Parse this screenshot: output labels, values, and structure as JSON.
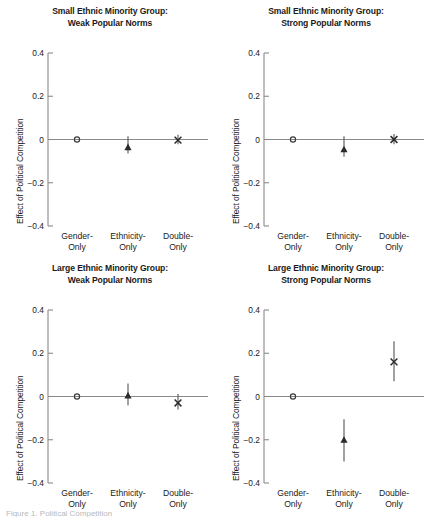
{
  "figure": {
    "ylabel": "Effect of Political Competition",
    "yticks": [
      "0.4",
      "0.2",
      "0",
      "−0.2",
      "−0.4"
    ],
    "categories": [
      {
        "line1": "Gender-",
        "line2": "Only"
      },
      {
        "line1": "Ethnicity-",
        "line2": "Only"
      },
      {
        "line1": "Double-",
        "line2": "Only"
      }
    ],
    "caption": "Figure 1. Political Competition"
  },
  "chart_data": {
    "type": "scatter",
    "xlabel": "",
    "ylabel": "Effect of Political Competition",
    "ylim": [
      -0.4,
      0.4
    ],
    "yticks": [
      0.4,
      0.2,
      0,
      -0.2,
      -0.4
    ],
    "grid": false,
    "legend": "none",
    "categories": [
      "Gender-Only",
      "Ethnicity-Only",
      "Double-Only"
    ],
    "markers": [
      "circle",
      "triangle",
      "cross"
    ],
    "panels": [
      {
        "id": "small-weak",
        "position": "top-left",
        "title_line1": "Small Ethnic Minority Group:",
        "title_line2": "Weak Popular Norms",
        "points": [
          {
            "category": "Gender-Only",
            "marker": "circle",
            "value": 0.0,
            "ci_low": 0.0,
            "ci_high": 0.0
          },
          {
            "category": "Ethnicity-Only",
            "marker": "triangle",
            "value": -0.035,
            "ci_low": -0.065,
            "ci_high": 0.015
          },
          {
            "category": "Double-Only",
            "marker": "cross",
            "value": -0.003,
            "ci_low": -0.022,
            "ci_high": 0.022
          }
        ]
      },
      {
        "id": "small-strong",
        "position": "top-right",
        "title_line1": "Small Ethnic Minority Group:",
        "title_line2": "Strong Popular Norms",
        "points": [
          {
            "category": "Gender-Only",
            "marker": "circle",
            "value": 0.0,
            "ci_low": 0.0,
            "ci_high": 0.0
          },
          {
            "category": "Ethnicity-Only",
            "marker": "triangle",
            "value": -0.045,
            "ci_low": -0.08,
            "ci_high": 0.015
          },
          {
            "category": "Double-Only",
            "marker": "cross",
            "value": 0.0,
            "ci_low": -0.022,
            "ci_high": 0.025
          }
        ]
      },
      {
        "id": "large-weak",
        "position": "bottom-left",
        "title_line1": "Large Ethnic Minority Group:",
        "title_line2": "Weak Popular Norms",
        "points": [
          {
            "category": "Gender-Only",
            "marker": "circle",
            "value": 0.0,
            "ci_low": 0.0,
            "ci_high": 0.0
          },
          {
            "category": "Ethnicity-Only",
            "marker": "triangle",
            "value": 0.005,
            "ci_low": -0.04,
            "ci_high": 0.06
          },
          {
            "category": "Double-Only",
            "marker": "cross",
            "value": -0.03,
            "ci_low": -0.06,
            "ci_high": 0.012
          }
        ]
      },
      {
        "id": "large-strong",
        "position": "bottom-right",
        "title_line1": "Large Ethnic Minority Group:",
        "title_line2": "Strong Popular Norms",
        "points": [
          {
            "category": "Gender-Only",
            "marker": "circle",
            "value": 0.0,
            "ci_low": 0.0,
            "ci_high": 0.0
          },
          {
            "category": "Ethnicity-Only",
            "marker": "triangle",
            "value": -0.2,
            "ci_low": -0.3,
            "ci_high": -0.105
          },
          {
            "category": "Double-Only",
            "marker": "cross",
            "value": 0.16,
            "ci_low": 0.07,
            "ci_high": 0.255
          }
        ]
      }
    ]
  }
}
